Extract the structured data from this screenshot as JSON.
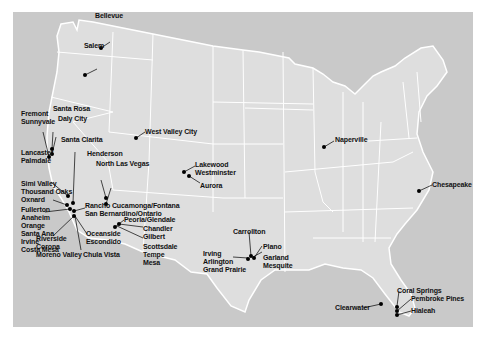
{
  "map": {
    "title": "US cities map",
    "colors": {
      "ocean": "#c9c9c9",
      "land": "#dedede",
      "borders": "#ffffff",
      "markers": "#000000",
      "labels": "#111111"
    },
    "labels": [
      {
        "id": "bellevue",
        "text": "Bellevue",
        "x": 95,
        "y": 11
      },
      {
        "id": "salem",
        "text": "Salem",
        "x": 84,
        "y": 42
      },
      {
        "id": "santa-rosa",
        "text": "Santa Rosa",
        "x": 53,
        "y": 92
      },
      {
        "id": "daly-city",
        "text": "Daly City",
        "x": 57,
        "y": 102
      },
      {
        "id": "fremont",
        "text": "Fremont",
        "x": 8,
        "y": 98
      },
      {
        "id": "sunnyvale",
        "text": "Sunnyvale",
        "x": 8,
        "y": 106
      },
      {
        "id": "santa-clarita",
        "text": "Santa Clarita",
        "x": 61,
        "y": 123
      },
      {
        "id": "lancaster",
        "text": "Lancaster",
        "x": 8,
        "y": 136
      },
      {
        "id": "palmdale",
        "text": "Palmdale",
        "x": 8,
        "y": 144
      },
      {
        "id": "henderson",
        "text": "Henderson",
        "x": 86,
        "y": 137
      },
      {
        "id": "north-las-vegas",
        "text": "North Las Vegas",
        "x": 96,
        "y": 147
      },
      {
        "id": "west-valley-city",
        "text": "West Valley City",
        "x": 132,
        "y": 115
      },
      {
        "id": "lakewood",
        "text": "Lakewood",
        "x": 183,
        "y": 148
      },
      {
        "id": "westminster",
        "text": "Westminster",
        "x": 183,
        "y": 156
      },
      {
        "id": "aurora",
        "text": "Aurora",
        "x": 187,
        "y": 169
      },
      {
        "id": "simi-valley",
        "text": "Simi Valley",
        "x": 8,
        "y": 168
      },
      {
        "id": "thousand-oaks",
        "text": "Thousand Oaks",
        "x": 8,
        "y": 176
      },
      {
        "id": "oxnard",
        "text": "Oxnard",
        "x": 8,
        "y": 184
      },
      {
        "id": "rancho",
        "text": "Rancho Cucamonga/Fontana",
        "x": 72,
        "y": 189
      },
      {
        "id": "san-bernardino",
        "text": "San Bernardino/Ontario",
        "x": 72,
        "y": 197
      },
      {
        "id": "fullerton",
        "text": "Fullerton",
        "x": 8,
        "y": 194
      },
      {
        "id": "anaheim",
        "text": "Anaheim",
        "x": 8,
        "y": 202
      },
      {
        "id": "orange",
        "text": "Orange",
        "x": 8,
        "y": 210
      },
      {
        "id": "santa-ana",
        "text": "Santa Ana",
        "x": 8,
        "y": 218
      },
      {
        "id": "irvine",
        "text": "Irvine",
        "x": 8,
        "y": 226
      },
      {
        "id": "costa-mesa",
        "text": "Costa Mesa",
        "x": 8,
        "y": 234
      },
      {
        "id": "peoria",
        "text": "Peoria/Glendale",
        "x": 111,
        "y": 192
      },
      {
        "id": "chandler",
        "text": "Chandler",
        "x": 131,
        "y": 203
      },
      {
        "id": "gilbert",
        "text": "Gilbert",
        "x": 131,
        "y": 211
      },
      {
        "id": "scottsdale",
        "text": "Scottsdale",
        "x": 131,
        "y": 222
      },
      {
        "id": "tempe",
        "text": "Tempe",
        "x": 131,
        "y": 230
      },
      {
        "id": "mesa",
        "text": "Mesa",
        "x": 131,
        "y": 238
      },
      {
        "id": "oceanside",
        "text": "Oceanside",
        "x": 73,
        "y": 218
      },
      {
        "id": "escondido",
        "text": "Escondido",
        "x": 73,
        "y": 226
      },
      {
        "id": "riverside",
        "text": "Riverside",
        "x": 23,
        "y": 223
      },
      {
        "id": "corona",
        "text": "Corona",
        "x": 23,
        "y": 231
      },
      {
        "id": "moreno-valley",
        "text": "Moreno Valley",
        "x": 23,
        "y": 239
      },
      {
        "id": "chula-vista",
        "text": "Chula Vista",
        "x": 70,
        "y": 238
      },
      {
        "id": "carrollton",
        "text": "Carrollton",
        "x": 220,
        "y": 206
      },
      {
        "id": "plano",
        "text": "Plano",
        "x": 249,
        "y": 222
      },
      {
        "id": "garland",
        "text": "Garland",
        "x": 249,
        "y": 233
      },
      {
        "id": "mesquite",
        "text": "Mesquite",
        "x": 249,
        "y": 241
      },
      {
        "id": "irving",
        "text": "Irving",
        "x": 191,
        "y": 229
      },
      {
        "id": "arlington",
        "text": "Arlington",
        "x": 191,
        "y": 237
      },
      {
        "id": "grand-prairie",
        "text": "Grand Prairie",
        "x": 191,
        "y": 245
      },
      {
        "id": "naperville",
        "text": "Naperville",
        "x": 322,
        "y": 134
      },
      {
        "id": "chesapeake",
        "text": "Chesapeake",
        "x": 420,
        "y": 171
      },
      {
        "id": "coral-springs",
        "text": "Coral Springs",
        "x": 385,
        "y": 271
      },
      {
        "id": "pembroke-pines",
        "text": "Pembroke Pines",
        "x": 399,
        "y": 283
      },
      {
        "id": "hialeah",
        "text": "Hialeah",
        "x": 399,
        "y": 294
      },
      {
        "id": "clearwater",
        "text": "Clearwater",
        "x": 322,
        "y": 294
      }
    ]
  }
}
